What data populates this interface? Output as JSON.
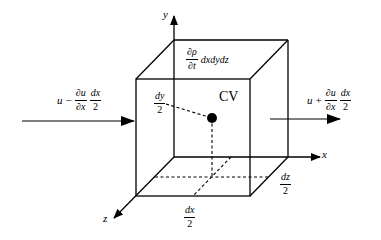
{
  "diagram": {
    "axes": {
      "x_label": "x",
      "y_label": "y",
      "z_label": "z"
    },
    "center_label": "CV",
    "storage_term": {
      "numerator": "∂ρ",
      "denominator": "∂t",
      "suffix": "dxdydz"
    },
    "inflow": {
      "prefix": "u",
      "operator": "−",
      "frac1_num": "∂u",
      "frac1_den": "∂x",
      "frac2_num": "dx",
      "frac2_den": "2"
    },
    "outflow": {
      "prefix": "u",
      "operator": "+",
      "frac1_num": "∂u",
      "frac1_den": "∂x",
      "frac2_num": "dx",
      "frac2_den": "2"
    },
    "half_dy": {
      "num": "dy",
      "den": "2"
    },
    "half_dx": {
      "num": "dx",
      "den": "2"
    },
    "half_dz": {
      "num": "dz",
      "den": "2"
    },
    "colors": {
      "line": "#000000",
      "background": "#ffffff"
    }
  }
}
